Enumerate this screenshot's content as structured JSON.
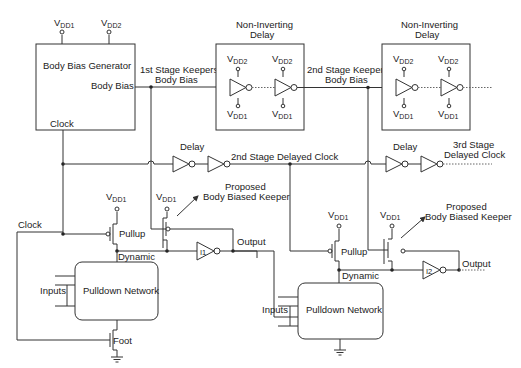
{
  "diagram": {
    "type": "circuit-schematic",
    "body_bias_generator": {
      "title": "Body Bias Generator",
      "out_label": "Body Bias",
      "clock_label": "Clock",
      "supply1": "V",
      "supply1_sub": "DD1",
      "supply2": "V",
      "supply2_sub": "DD2"
    },
    "stage1_bias_label": [
      "1st Stage Keepers",
      "Body Bias"
    ],
    "stage2_bias_label": [
      "2nd Stage Keepers",
      "Body Bias"
    ],
    "delay_blocks": [
      {
        "title": [
          "Non-Inverting",
          "Delay"
        ],
        "vdd_top": "V",
        "vdd_top_sub": "DD2",
        "vdd_bottom": "V",
        "vdd_bottom_sub": "DD1"
      },
      {
        "title": [
          "Non-Inverting",
          "Delay"
        ],
        "vdd_top": "V",
        "vdd_top_sub": "DD2",
        "vdd_bottom": "V",
        "vdd_bottom_sub": "DD1"
      }
    ],
    "clock_delays": [
      {
        "label": "Delay",
        "output_label": "2nd Stage Delayed Clock"
      },
      {
        "label": "Delay",
        "output_label": [
          "3rd Stage",
          "Delayed Clock"
        ]
      }
    ],
    "stage1": {
      "clock_label": "Clock",
      "pullup_label": "Pullup",
      "vdd_label": "V",
      "vdd_sub": "DD1",
      "dynamic_label": "Dynamic",
      "pdn_label": "Pulldown Network",
      "inputs_label": "Inputs",
      "foot_label": "Foot",
      "keeper_vdd": "V",
      "keeper_vdd_sub": "DD1",
      "keeper_label": [
        "Proposed",
        "Body Biased Keeper"
      ],
      "inverter_label": "I1",
      "output_label": "Output"
    },
    "stage2": {
      "pullup_label": "Pullup",
      "vdd_label": "V",
      "vdd_sub": "DD1",
      "dynamic_label": "Dynamic",
      "pdn_label": "Pulldown Network",
      "inputs_label": "Inputs",
      "keeper_vdd": "V",
      "keeper_vdd_sub": "DD1",
      "keeper_label": [
        "Proposed",
        "Body Biased Keeper"
      ],
      "inverter_label": "I2",
      "output_label": "Output"
    }
  }
}
